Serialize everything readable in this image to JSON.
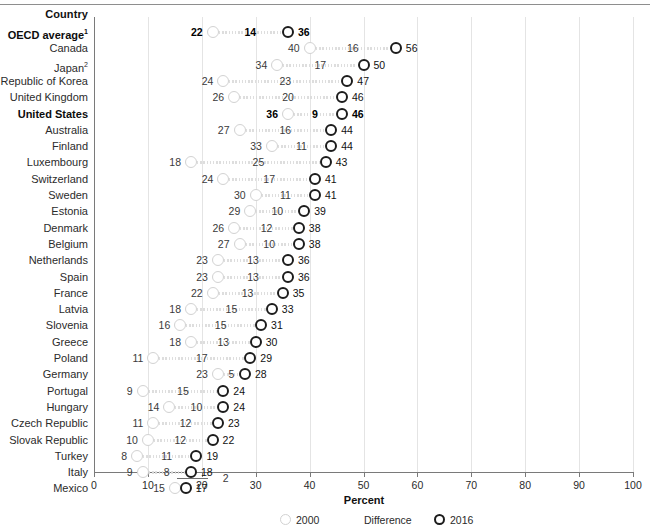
{
  "header": {
    "country_column_label": "Country"
  },
  "axis": {
    "x_title": "Percent",
    "ticks": [
      0,
      10,
      20,
      30,
      40,
      50,
      60,
      70,
      80,
      90,
      100
    ],
    "x_min": 0,
    "x_max": 100
  },
  "legend": {
    "series_2000": "2000",
    "series_difference": "Difference",
    "series_2016": "2016"
  },
  "colors": {
    "marker_2000": "#d2d2d2",
    "marker_2016": "#1c1c1c",
    "axis": "#7a7a7a",
    "gridline": "#e4e4e4",
    "text": "#2b2b2b"
  },
  "chart_data": {
    "type": "scatter",
    "title": "",
    "xlabel": "Percent",
    "ylabel": "Country",
    "xlim": [
      0,
      100
    ],
    "grid": true,
    "legend_position": "bottom",
    "categories": [
      "OECD average¹",
      "Canada",
      "Japan²",
      "Republic of Korea",
      "United Kingdom",
      "United States",
      "Australia",
      "Finland",
      "Luxembourg",
      "Switzerland",
      "Sweden",
      "Estonia",
      "Denmark",
      "Belgium",
      "Netherlands",
      "Spain",
      "France",
      "Latvia",
      "Slovenia",
      "Greece",
      "Poland",
      "Germany",
      "Portugal",
      "Hungary",
      "Czech Republic",
      "Slovak Republic",
      "Turkey",
      "Italy",
      "Mexico"
    ],
    "series": [
      {
        "name": "2000",
        "values": [
          22,
          40,
          34,
          24,
          26,
          36,
          27,
          33,
          18,
          24,
          30,
          29,
          26,
          27,
          23,
          23,
          22,
          18,
          16,
          18,
          11,
          23,
          9,
          14,
          11,
          10,
          8,
          9,
          15
        ]
      },
      {
        "name": "Difference",
        "values": [
          14,
          16,
          17,
          23,
          20,
          9,
          16,
          11,
          25,
          17,
          11,
          10,
          12,
          10,
          13,
          13,
          13,
          15,
          15,
          13,
          17,
          5,
          15,
          10,
          12,
          12,
          11,
          8,
          2
        ]
      },
      {
        "name": "2016",
        "values": [
          36,
          56,
          50,
          47,
          46,
          46,
          44,
          44,
          43,
          41,
          41,
          39,
          38,
          38,
          36,
          36,
          35,
          33,
          31,
          30,
          29,
          28,
          24,
          24,
          23,
          22,
          19,
          18,
          17
        ]
      }
    ]
  },
  "rows": [
    {
      "country": "OECD average",
      "sup": "1",
      "bold": true,
      "v2000": 22,
      "diff": 14,
      "v2016": 36
    },
    {
      "country": "Canada",
      "sup": "",
      "bold": false,
      "v2000": 40,
      "diff": 16,
      "v2016": 56
    },
    {
      "country": "Japan",
      "sup": "2",
      "bold": false,
      "v2000": 34,
      "diff": 17,
      "v2016": 50
    },
    {
      "country": "Republic of Korea",
      "sup": "",
      "bold": false,
      "v2000": 24,
      "diff": 23,
      "v2016": 47
    },
    {
      "country": "United Kingdom",
      "sup": "",
      "bold": false,
      "v2000": 26,
      "diff": 20,
      "v2016": 46
    },
    {
      "country": "United States",
      "sup": "",
      "bold": true,
      "v2000": 36,
      "diff": 9,
      "v2016": 46
    },
    {
      "country": "Australia",
      "sup": "",
      "bold": false,
      "v2000": 27,
      "diff": 16,
      "v2016": 44
    },
    {
      "country": "Finland",
      "sup": "",
      "bold": false,
      "v2000": 33,
      "diff": 11,
      "v2016": 44
    },
    {
      "country": "Luxembourg",
      "sup": "",
      "bold": false,
      "v2000": 18,
      "diff": 25,
      "v2016": 43
    },
    {
      "country": "Switzerland",
      "sup": "",
      "bold": false,
      "v2000": 24,
      "diff": 17,
      "v2016": 41
    },
    {
      "country": "Sweden",
      "sup": "",
      "bold": false,
      "v2000": 30,
      "diff": 11,
      "v2016": 41
    },
    {
      "country": "Estonia",
      "sup": "",
      "bold": false,
      "v2000": 29,
      "diff": 10,
      "v2016": 39
    },
    {
      "country": "Denmark",
      "sup": "",
      "bold": false,
      "v2000": 26,
      "diff": 12,
      "v2016": 38
    },
    {
      "country": "Belgium",
      "sup": "",
      "bold": false,
      "v2000": 27,
      "diff": 10,
      "v2016": 38
    },
    {
      "country": "Netherlands",
      "sup": "",
      "bold": false,
      "v2000": 23,
      "diff": 13,
      "v2016": 36
    },
    {
      "country": "Spain",
      "sup": "",
      "bold": false,
      "v2000": 23,
      "diff": 13,
      "v2016": 36
    },
    {
      "country": "France",
      "sup": "",
      "bold": false,
      "v2000": 22,
      "diff": 13,
      "v2016": 35
    },
    {
      "country": "Latvia",
      "sup": "",
      "bold": false,
      "v2000": 18,
      "diff": 15,
      "v2016": 33
    },
    {
      "country": "Slovenia",
      "sup": "",
      "bold": false,
      "v2000": 16,
      "diff": 15,
      "v2016": 31
    },
    {
      "country": "Greece",
      "sup": "",
      "bold": false,
      "v2000": 18,
      "diff": 13,
      "v2016": 30
    },
    {
      "country": "Poland",
      "sup": "",
      "bold": false,
      "v2000": 11,
      "diff": 17,
      "v2016": 29
    },
    {
      "country": "Germany",
      "sup": "",
      "bold": false,
      "v2000": 23,
      "diff": 5,
      "v2016": 28
    },
    {
      "country": "Portugal",
      "sup": "",
      "bold": false,
      "v2000": 9,
      "diff": 15,
      "v2016": 24
    },
    {
      "country": "Hungary",
      "sup": "",
      "bold": false,
      "v2000": 14,
      "diff": 10,
      "v2016": 24
    },
    {
      "country": "Czech Republic",
      "sup": "",
      "bold": false,
      "v2000": 11,
      "diff": 12,
      "v2016": 23
    },
    {
      "country": "Slovak Republic",
      "sup": "",
      "bold": false,
      "v2000": 10,
      "diff": 12,
      "v2016": 22
    },
    {
      "country": "Turkey",
      "sup": "",
      "bold": false,
      "v2000": 8,
      "diff": 11,
      "v2016": 19
    },
    {
      "country": "Italy",
      "sup": "",
      "bold": false,
      "v2000": 9,
      "diff": 8,
      "v2016": 18
    },
    {
      "country": "Mexico",
      "sup": "",
      "bold": false,
      "v2000": 15,
      "diff": 2,
      "v2016": 17,
      "diff_offset": true
    }
  ]
}
